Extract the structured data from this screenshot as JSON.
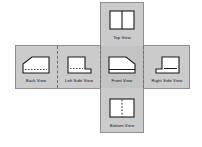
{
  "diagram": {
    "background_color": "#ffffff",
    "band_color": "#cbcbcb",
    "band_border_color": "#8e8e8e",
    "fold_line_color": "#6f6f6f",
    "object_fill_color": "#ffffff",
    "object_line_color": "#1a1a1a",
    "hidden_line_style": "dashed"
  },
  "views": {
    "top": {
      "label": "Top View",
      "shape": "rectangle-with-vertical-center-line",
      "hidden_lines": false
    },
    "back": {
      "label": "Back View",
      "shape": "trapezoid-chamfer-upper-left",
      "hidden_lines": true
    },
    "left_side": {
      "label": "Left Side View",
      "shape": "stepped-L-profile-foot-right",
      "hidden_lines": true
    },
    "front": {
      "label": "Front View",
      "shape": "trapezoid-chamfer-upper-right",
      "hidden_lines": false
    },
    "right_side": {
      "label": "Right Side View",
      "shape": "stepped-L-profile-foot-left",
      "hidden_lines": false
    },
    "bottom": {
      "label": "Bottom View",
      "shape": "rectangle-with-dashed-vertical-center-line",
      "hidden_lines": true
    }
  }
}
